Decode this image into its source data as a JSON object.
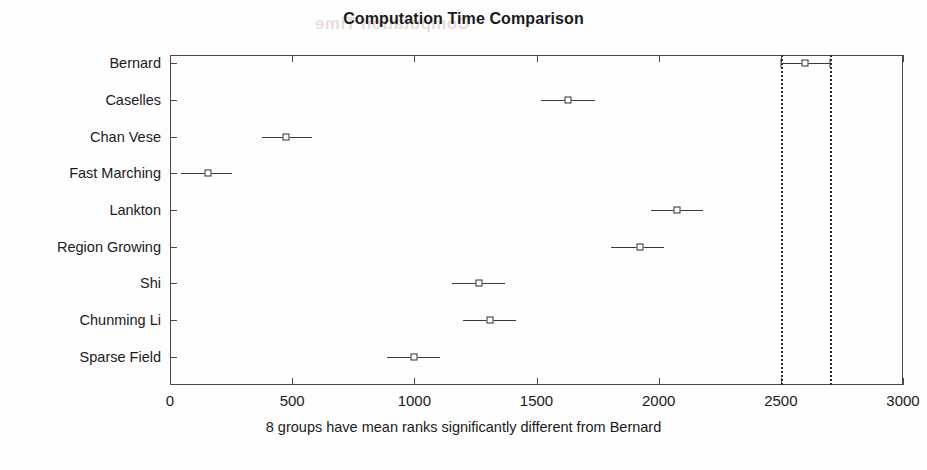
{
  "chart_data": {
    "type": "scatter",
    "title": "Computation Time Comparison",
    "xlabel": "8 groups have mean ranks significantly different from Bernard",
    "ylabel": "",
    "xlim": [
      0,
      3000
    ],
    "xticks": [
      0,
      500,
      1000,
      1500,
      2000,
      2500,
      3000
    ],
    "xticklabels": [
      "0",
      "500",
      "1000",
      "1500",
      "2000",
      "2500",
      "3000"
    ],
    "grid": false,
    "legend": null,
    "categories": [
      "Bernard",
      "Caselles",
      "Chan Vese",
      "Fast Marching",
      "Lankton",
      "Region Growing",
      "Shi",
      "Chunming Li",
      "Sparse Field"
    ],
    "series": [
      {
        "name": "mean rank with comparison interval",
        "points": [
          {
            "category": "Bernard",
            "center": 2600,
            "lower": 2500,
            "upper": 2700,
            "highlighted": true
          },
          {
            "category": "Caselles",
            "center": 1630,
            "lower": 1520,
            "upper": 1740,
            "highlighted": false
          },
          {
            "category": "Chan Vese",
            "center": 475,
            "lower": 375,
            "upper": 580,
            "highlighted": false
          },
          {
            "category": "Fast Marching",
            "center": 155,
            "lower": 45,
            "upper": 255,
            "highlighted": false
          },
          {
            "category": "Lankton",
            "center": 2075,
            "lower": 1970,
            "upper": 2180,
            "highlighted": false
          },
          {
            "category": "Region Growing",
            "center": 1925,
            "lower": 1805,
            "upper": 2020,
            "highlighted": false
          },
          {
            "category": "Shi",
            "center": 1265,
            "lower": 1155,
            "upper": 1370,
            "highlighted": false
          },
          {
            "category": "Chunming Li",
            "center": 1310,
            "lower": 1200,
            "upper": 1415,
            "highlighted": false
          },
          {
            "category": "Sparse Field",
            "center": 1000,
            "lower": 890,
            "upper": 1105,
            "highlighted": false
          }
        ]
      }
    ],
    "reference_lines": [
      {
        "x": 2500,
        "style": "dotted"
      },
      {
        "x": 2700,
        "style": "dotted"
      }
    ],
    "colors": {
      "line": "#3a3a3a",
      "marker_edge": "#2e2e2e",
      "marker_face": "#ffffff",
      "axis": "#4a4a4a",
      "text": "#1b1b1b",
      "background": "#fdfdfd"
    }
  },
  "artifact": {
    "ghost_text": "Computation Time"
  }
}
